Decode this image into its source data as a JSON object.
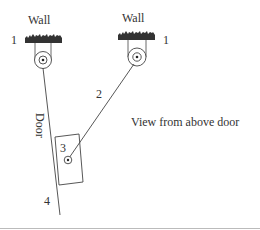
{
  "diagram": {
    "walls": [
      {
        "label": "Wall",
        "number": "1"
      },
      {
        "label": "Wall",
        "number": "1"
      }
    ],
    "rope_label": "2",
    "door_pulley_label": "3",
    "door_label": "Door",
    "door_end_label": "4",
    "caption": "View from above door",
    "colors": {
      "line": "#444444",
      "wall_fill": "#333333",
      "text": "#333333",
      "bottom_rule": "#bbbbbb"
    }
  }
}
